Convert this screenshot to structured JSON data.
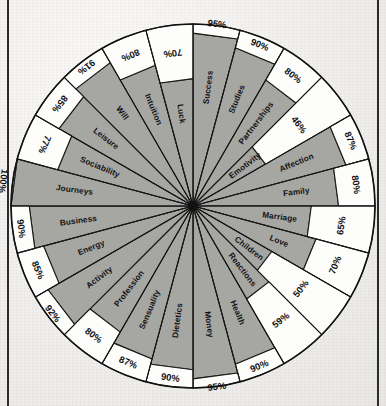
{
  "page": {
    "background_color": "#f2f1ef",
    "rule_color": "#2b2b2b"
  },
  "chart_data": {
    "type": "bar",
    "variant": "polar-radial-sector",
    "title": "",
    "subtitle": "",
    "xlabel": "",
    "ylabel": "",
    "unit": "%",
    "rmin": 0,
    "rmax": 100,
    "grid": false,
    "legend": "none",
    "fill_color": "#a6a6a3",
    "empty_color": "#fdfdfc",
    "line_color": "#1a1a1a",
    "start_angle_deg": -90,
    "direction": "clockwise",
    "categories": [
      "Success",
      "Studies",
      "Partnerships",
      "Emotivity",
      "Affection",
      "Family",
      "Marriage",
      "Love",
      "Children",
      "Reactions",
      "Health",
      "Money",
      "Dietetics",
      "Sensuality",
      "Profession",
      "Activity",
      "Energy",
      "Business",
      "Journeys",
      "Sociability",
      "Leisure",
      "Will",
      "Intuition",
      "Luck"
    ],
    "values": [
      95,
      90,
      80,
      46,
      87,
      80,
      65,
      70,
      50,
      59,
      90,
      95,
      90,
      87,
      80,
      92,
      85,
      90,
      100,
      77,
      85,
      91,
      80,
      70
    ],
    "value_labels": [
      "95%",
      "90%",
      "80%",
      "46%",
      "87%",
      "80%",
      "65%",
      "70%",
      "50%",
      "59%",
      "90%",
      "95%",
      "90%",
      "87%",
      "80%",
      "92%",
      "85%",
      "90%",
      "100%",
      "77%",
      "85%",
      "91%",
      "80%",
      "70%"
    ]
  }
}
